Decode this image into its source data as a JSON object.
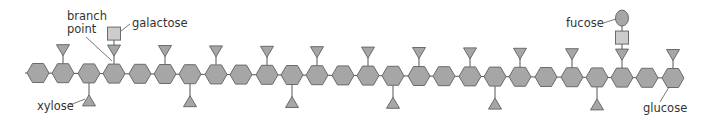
{
  "diagram": {
    "type": "xyloglucan-polysaccharide-chain",
    "colors": {
      "hexagon_fill": "#a6a6a6",
      "hexagon_stroke": "#6b6b6b",
      "triangle_fill": "#a6a6a6",
      "square_fill": "#cccccc",
      "ellipse_fill": "#a6a6a6",
      "line": "#555555",
      "text": "#333333"
    },
    "backbone": {
      "line_start_x": 25,
      "y_left": 73,
      "y_right": 78,
      "units": [
        {
          "x": 38,
          "branch": "none"
        },
        {
          "x": 63,
          "branch": "top"
        },
        {
          "x": 89,
          "branch": "bottom"
        },
        {
          "x": 114,
          "branch": "top",
          "extra": [
            "square"
          ]
        },
        {
          "x": 140,
          "branch": "none"
        },
        {
          "x": 165,
          "branch": "top"
        },
        {
          "x": 190,
          "branch": "bottom"
        },
        {
          "x": 216,
          "branch": "top"
        },
        {
          "x": 241,
          "branch": "none"
        },
        {
          "x": 267,
          "branch": "top"
        },
        {
          "x": 292,
          "branch": "bottom"
        },
        {
          "x": 317,
          "branch": "top"
        },
        {
          "x": 343,
          "branch": "none"
        },
        {
          "x": 368,
          "branch": "top"
        },
        {
          "x": 393,
          "branch": "bottom"
        },
        {
          "x": 419,
          "branch": "top"
        },
        {
          "x": 444,
          "branch": "none"
        },
        {
          "x": 470,
          "branch": "top"
        },
        {
          "x": 495,
          "branch": "bottom"
        },
        {
          "x": 520,
          "branch": "top"
        },
        {
          "x": 546,
          "branch": "none"
        },
        {
          "x": 572,
          "branch": "top"
        },
        {
          "x": 597,
          "branch": "bottom"
        },
        {
          "x": 622,
          "branch": "top",
          "extra": [
            "square",
            "ellipse"
          ]
        },
        {
          "x": 647,
          "branch": "none"
        },
        {
          "x": 673,
          "branch": "top"
        }
      ]
    },
    "labels": {
      "branch_point_line1": "branch",
      "branch_point_line2": "point",
      "galactose": "galactose",
      "xylose": "xylose",
      "fucose": "fucose",
      "glucose": "glucose"
    },
    "legend_shapes": {
      "glucose": "hexagon",
      "xylose": "triangle",
      "galactose": "square",
      "fucose": "ellipse"
    }
  }
}
